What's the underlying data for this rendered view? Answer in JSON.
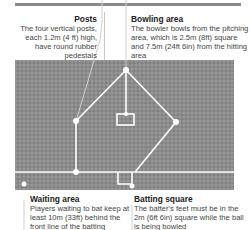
{
  "diagram": {
    "colors": {
      "field": "#8c8c8c",
      "lines": "#ffffff",
      "top_bar": "#8a8a8a",
      "leader_lines": "#b0b0b0",
      "title_text": "#222222",
      "body_text": "#444444"
    },
    "callouts": {
      "posts": {
        "title": "Posts",
        "body": "The four vertical posts, each 1.2m (4 ft) high, have round rubber pedestals"
      },
      "bowling_area": {
        "title": "Bowling area",
        "body": "The bowler bowls from the pitching area, which is 2.5m (8ft) square and 7.5m (24ft 6in) from the hitting area"
      },
      "waiting_area": {
        "title": "Waiting area",
        "body": "Players waiting to bat keep at least 10m (33ft) behind the front line of the batting square"
      },
      "batting_square": {
        "title": "Batting square",
        "body": "The batter's feet must be in the 2m (6ft 6in) square while the ball is being bowled"
      }
    },
    "elements": {
      "posts": [
        "top-post",
        "left-post",
        "right-post",
        "bottom-left-post"
      ],
      "icons": [
        "post-marker-icon",
        "bowling-square-icon",
        "batting-square-icon"
      ]
    }
  }
}
